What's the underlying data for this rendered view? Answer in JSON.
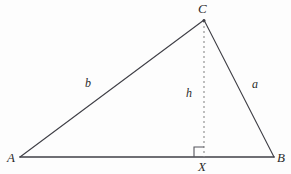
{
  "figure": {
    "kind": "geometry-diagram",
    "canvas": {
      "width": 291,
      "height": 174
    },
    "background_color": "#fdfdfd",
    "stroke_color": "#3f3f46",
    "dash_color": "#8a8a8a",
    "label_color": "#2b2b2b",
    "vertices": {
      "A": {
        "label": "A",
        "x": 20,
        "y": 157,
        "label_x": 7,
        "label_y": 151
      },
      "B": {
        "label": "B",
        "x": 274,
        "y": 157,
        "label_x": 277,
        "label_y": 151
      },
      "C": {
        "label": "C",
        "x": 204,
        "y": 20,
        "label_x": 198,
        "label_y": 2
      },
      "X": {
        "label": "X",
        "x": 204,
        "y": 157,
        "label_x": 198,
        "label_y": 160
      }
    },
    "sides": {
      "b": {
        "label": "b",
        "from": "A",
        "to": "C",
        "label_x": 85,
        "label_y": 77
      },
      "a": {
        "label": "a",
        "from": "C",
        "to": "B",
        "label_x": 252,
        "label_y": 78
      },
      "c": {
        "label": "",
        "from": "A",
        "to": "B"
      },
      "h": {
        "label": "h",
        "from": "C",
        "to": "X",
        "label_x": 186,
        "label_y": 87,
        "style": "dashed"
      }
    },
    "right_angle": {
      "at": "X",
      "size": 10,
      "side": "left",
      "symbol_name": "right-angle-square"
    }
  }
}
